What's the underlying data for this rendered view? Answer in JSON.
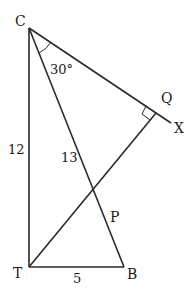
{
  "diagram": {
    "points": {
      "C": "C",
      "T": "T",
      "B": "B",
      "P": "P",
      "Q": "Q",
      "X": "X"
    },
    "labels": {
      "angle_C": "30°",
      "side_CT": "12",
      "side_CB": "13",
      "side_TB": "5"
    },
    "segments": [
      "CT",
      "TB",
      "CB",
      "CX",
      "TQ"
    ],
    "right_angle_at": "Q"
  }
}
